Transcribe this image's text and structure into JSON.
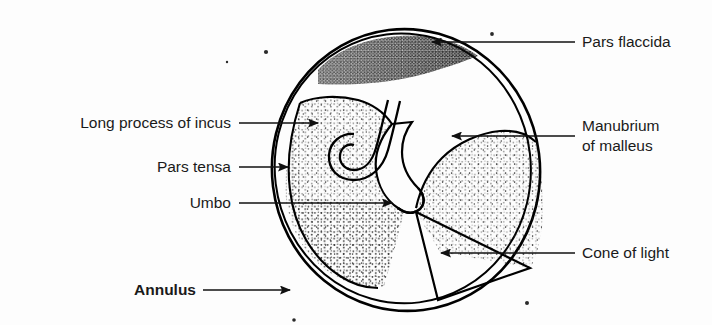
{
  "figure": {
    "background_color": "#fdfdfd",
    "ink_color": "#111111"
  },
  "labels": [
    {
      "id": "long-process-of-incus",
      "text": "Long process of incus",
      "side": "left",
      "bold": false,
      "text_x": 231,
      "text_y": 128,
      "leader": {
        "x1": 239,
        "y1": 123,
        "x2": 318,
        "y2": 123
      },
      "arrow": "right"
    },
    {
      "id": "pars-tensa",
      "text": "Pars tensa",
      "side": "left",
      "bold": false,
      "text_x": 231,
      "text_y": 172,
      "leader": {
        "x1": 239,
        "y1": 167,
        "x2": 288,
        "y2": 167
      },
      "arrow": "right"
    },
    {
      "id": "umbo",
      "text": "Umbo",
      "side": "left",
      "bold": false,
      "text_x": 231,
      "text_y": 208,
      "leader": {
        "x1": 239,
        "y1": 203,
        "x2": 392,
        "y2": 203
      },
      "arrow": "right"
    },
    {
      "id": "annulus",
      "text": "Annulus",
      "side": "left",
      "bold": true,
      "text_x": 196,
      "text_y": 295,
      "leader": {
        "x1": 203,
        "y1": 290,
        "x2": 290,
        "y2": 290
      },
      "arrow": "right"
    },
    {
      "id": "pars-flaccida",
      "text": "Pars flaccida",
      "side": "right",
      "bold": false,
      "text_x": 582,
      "text_y": 47,
      "leader": {
        "x1": 575,
        "y1": 42,
        "x2": 432,
        "y2": 42
      },
      "arrow": "left"
    },
    {
      "id": "manubrium-of-malleus",
      "text": "Manubrium",
      "text_line2": "of malleus",
      "side": "right",
      "bold": false,
      "text_x": 582,
      "text_y": 131,
      "leader": {
        "x1": 575,
        "y1": 136,
        "x2": 452,
        "y2": 136
      },
      "arrow": "left"
    },
    {
      "id": "cone-of-light",
      "text": "Cone of light",
      "side": "right",
      "bold": false,
      "text_x": 582,
      "text_y": 258,
      "leader": {
        "x1": 575,
        "y1": 253,
        "x2": 441,
        "y2": 253
      },
      "arrow": "left"
    }
  ],
  "regions": [
    {
      "id": "membrane-outline",
      "name": "tympanic membrane outline"
    },
    {
      "id": "annulus-ring",
      "name": "annulus fibrous ring"
    },
    {
      "id": "pars-flaccida-region",
      "name": "pars flaccida (Shrapnell's membrane)"
    },
    {
      "id": "pars-tensa-left-lobe",
      "name": "pars tensa anterior lobe"
    },
    {
      "id": "pars-tensa-right-lobe",
      "name": "pars tensa posterior lobe"
    },
    {
      "id": "manubrium-band",
      "name": "manubrium of malleus band"
    },
    {
      "id": "incus-hook",
      "name": "long process of incus"
    },
    {
      "id": "umbo-tip",
      "name": "umbo"
    },
    {
      "id": "cone-of-light-wedge",
      "name": "cone of light wedge"
    }
  ],
  "specks": [
    {
      "x": 266,
      "y": 52,
      "r": 2.1
    },
    {
      "x": 492,
      "y": 34,
      "r": 1.9
    },
    {
      "x": 527,
      "y": 303,
      "r": 2.0
    },
    {
      "x": 294,
      "y": 320,
      "r": 1.8
    },
    {
      "x": 227,
      "y": 62,
      "r": 1.2
    }
  ]
}
